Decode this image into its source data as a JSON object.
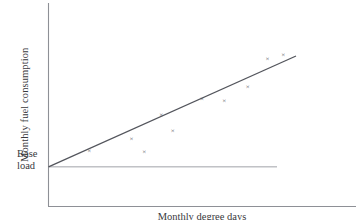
{
  "chart_data": {
    "type": "scatter",
    "title": "",
    "xlabel": "Monthly degree days",
    "ylabel": "Monthly fuel consumption",
    "xlim": [
      0,
      100
    ],
    "ylim": [
      0,
      100
    ],
    "grid": false,
    "legend": null,
    "marker_symbol": "×",
    "annotations": [
      {
        "name": "base-load",
        "text_line1": "Base",
        "text_line2": "load",
        "y_value": 20.6,
        "description": "Horizontal reference line marking the base load intercept"
      }
    ],
    "points": [
      {
        "x": 16.5,
        "y": 29.0
      },
      {
        "x": 33.5,
        "y": 35.3
      },
      {
        "x": 38.7,
        "y": 28.7
      },
      {
        "x": 45.5,
        "y": 48.0
      },
      {
        "x": 50.2,
        "y": 39.3
      },
      {
        "x": 62.0,
        "y": 56.2
      },
      {
        "x": 71.0,
        "y": 55.2
      },
      {
        "x": 80.5,
        "y": 62.5
      },
      {
        "x": 88.5,
        "y": 76.8
      },
      {
        "x": 94.8,
        "y": 79.0
      }
    ],
    "trend_line": {
      "name": "fitted-line",
      "x_start": 0.0,
      "y_start": 20.6,
      "x_end": 100.0,
      "y_end": 78.2,
      "slope": 0.576,
      "intercept": 20.6
    },
    "colors": {
      "axis": "#8e9096",
      "baseload": "#a0a2a8",
      "trend": "#53555c",
      "marker": "#4a4c52",
      "text": "#39393d",
      "background": "#ffffff"
    }
  }
}
